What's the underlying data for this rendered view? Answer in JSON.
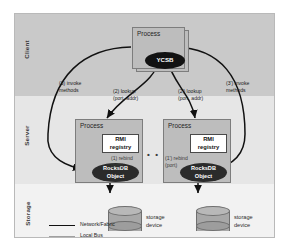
{
  "diagram": {
    "tiers": [
      {
        "name": "client",
        "label": "Client"
      },
      {
        "name": "server",
        "label": "Server"
      },
      {
        "name": "storage",
        "label": "Storage"
      }
    ],
    "client": {
      "process_label": "Process",
      "node_label": "YCSB"
    },
    "servers": [
      {
        "process_label": "Process",
        "registry_line1": "RMI",
        "registry_line2": "registry",
        "object_line1": "RocksDB",
        "object_line2": "Object",
        "rebind_line1": "(1) rebind",
        "rebind_line2": "(port)"
      },
      {
        "process_label": "Process",
        "registry_line1": "RMI",
        "registry_line2": "registry",
        "object_line1": "RocksDB",
        "object_line2": "Object",
        "rebind_line1": "(1') rebind",
        "rebind_line2": "(port)"
      }
    ],
    "ellipsis": "• • •",
    "storage_devices": [
      {
        "caption_line1": "storage",
        "caption_line2": "device"
      },
      {
        "caption_line1": "storage",
        "caption_line2": "device"
      }
    ],
    "edges": [
      {
        "id": "invoke-left",
        "line1": "(3) invoke",
        "line2": "methods"
      },
      {
        "id": "lookup-left",
        "line1": "(2) lookup",
        "line2": "(port, addr)"
      },
      {
        "id": "lookup-right",
        "line1": "(2') lookup",
        "line2": "(port, addr)"
      },
      {
        "id": "invoke-right",
        "line1": "(3') invoke",
        "line2": "methods"
      }
    ],
    "legend": {
      "items": [
        {
          "label": "Network/Fabric",
          "color": "#111111",
          "style": "solid-thick"
        },
        {
          "label": "Local Bus",
          "color": "#a0a0a0",
          "style": "solid-thin"
        }
      ]
    },
    "colors": {
      "band_client": "#c9c9c9",
      "band_server": "#e6e6e6",
      "band_storage": "#f2f2f2",
      "process_fill": "#bdbdbd",
      "node_fill": "#121212",
      "registry_fill": "#ffffff",
      "network_edge": "#111111",
      "local_bus_edge": "#a0a0a0"
    }
  }
}
